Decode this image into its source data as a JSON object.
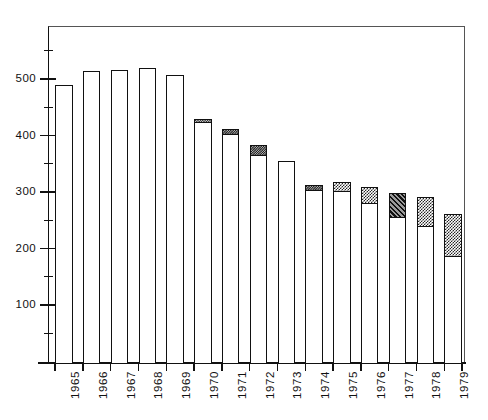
{
  "chart_data": {
    "type": "bar",
    "title": "",
    "subtitle": "",
    "xlabel": "",
    "ylabel": "",
    "ylim": [
      0,
      600
    ],
    "grid": false,
    "legend": "none",
    "stacked": true,
    "categories": [
      "1965",
      "1966",
      "1967",
      "1968",
      "1969",
      "1970",
      "1971",
      "1972",
      "1973",
      "1974",
      "1975",
      "1976",
      "1977",
      "1978",
      "1979"
    ],
    "y_ticks_major": [
      100,
      200,
      300,
      400,
      500
    ],
    "y_ticks_major_labels": [
      "100",
      "200",
      "300",
      "400",
      "500"
    ],
    "y_ticks_minor": [
      50,
      150,
      250,
      350,
      450,
      550
    ],
    "series": [
      {
        "name": "lower-open-segment",
        "fill": "white",
        "values": [
          492,
          517,
          519,
          522,
          510,
          425,
          403,
          366,
          358,
          304,
          303,
          281,
          256,
          240,
          187
        ]
      },
      {
        "name": "upper-shaded-segment",
        "fill": "hatched",
        "values": [
          0,
          0,
          0,
          0,
          0,
          7,
          11,
          20,
          0,
          11,
          17,
          30,
          45,
          54,
          77
        ]
      }
    ],
    "totals": [
      492,
      517,
      519,
      522,
      510,
      432,
      414,
      386,
      358,
      315,
      320,
      311,
      301,
      294,
      264
    ],
    "segment_patterns": [
      "none",
      "none",
      "none",
      "none",
      "none",
      "dense",
      "dense",
      "dense",
      "none",
      "dense",
      "checker",
      "checker",
      "diagonal",
      "checker",
      "checker"
    ],
    "colors": {
      "axis": "#111111",
      "bar_outline": "#111111",
      "bar_face": "#ffffff",
      "shade_dark": "#262626",
      "background": "#ffffff"
    }
  }
}
